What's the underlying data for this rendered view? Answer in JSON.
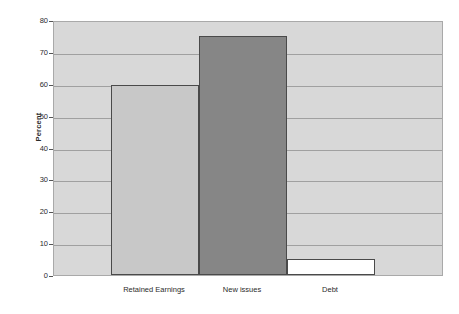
{
  "chart_data": {
    "type": "bar",
    "title": "",
    "subtitle": "",
    "xlabel": "",
    "ylabel": "Percent",
    "categories": [
      "Retained Earnings",
      "New issues",
      "Debt"
    ],
    "values": [
      59.5,
      75,
      5
    ],
    "ylim": [
      0,
      80
    ],
    "y_ticks": [
      0,
      10,
      20,
      30,
      40,
      50,
      60,
      70,
      80
    ],
    "y_tick_labels": [
      "0",
      "10",
      "20",
      "30",
      "40",
      "50",
      "60",
      "70",
      "80"
    ],
    "grid": true,
    "legend": "none",
    "bar_colors": [
      "#c8c8c8",
      "#868686",
      "#ffffff"
    ],
    "bar_edge_color": "#4a4a4a",
    "plot_background": "#d8d8d8",
    "figure_background": "#ffffff",
    "gridline_color": "#a0a0a0",
    "series": [
      {
        "name": "Percent",
        "values": [
          59.5,
          75,
          5
        ]
      }
    ]
  }
}
